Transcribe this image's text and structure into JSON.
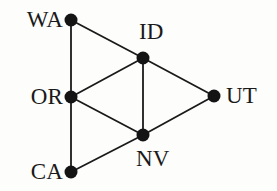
{
  "figure": {
    "background_color": "#fdfdfc",
    "edge_color": "#1a1a1a",
    "node_color": "#141414",
    "label_color": "#1a1a1a",
    "width": 277,
    "height": 191
  },
  "chart_data": {
    "type": "diagram",
    "subtype": "node-link-graph",
    "title": "",
    "directed": false,
    "nodes": [
      {
        "id": "WA",
        "label": "WA",
        "x": 71,
        "y": 20,
        "r": 6.5,
        "label_x": 63,
        "label_y": 20,
        "label_anchor": "right"
      },
      {
        "id": "OR",
        "label": "OR",
        "x": 71,
        "y": 97,
        "r": 6.5,
        "label_x": 63,
        "label_y": 97,
        "label_anchor": "right"
      },
      {
        "id": "CA",
        "label": "CA",
        "x": 71,
        "y": 172,
        "r": 6.5,
        "label_x": 63,
        "label_y": 172,
        "label_anchor": "right"
      },
      {
        "id": "ID",
        "label": "ID",
        "x": 143,
        "y": 58,
        "r": 6.5,
        "label_x": 139,
        "label_y": 32,
        "label_anchor": "left"
      },
      {
        "id": "NV",
        "label": "NV",
        "x": 143,
        "y": 135,
        "r": 6.5,
        "label_x": 136,
        "label_y": 159,
        "label_anchor": "left"
      },
      {
        "id": "UT",
        "label": "UT",
        "x": 214,
        "y": 96,
        "r": 6.5,
        "label_x": 226,
        "label_y": 96,
        "label_anchor": "left"
      }
    ],
    "edges": [
      {
        "source": "WA",
        "target": "OR"
      },
      {
        "source": "OR",
        "target": "CA"
      },
      {
        "source": "WA",
        "target": "ID"
      },
      {
        "source": "OR",
        "target": "ID"
      },
      {
        "source": "OR",
        "target": "NV"
      },
      {
        "source": "CA",
        "target": "NV"
      },
      {
        "source": "ID",
        "target": "NV"
      },
      {
        "source": "ID",
        "target": "UT"
      },
      {
        "source": "NV",
        "target": "UT"
      }
    ],
    "edge_width": 1.8,
    "legend": null,
    "grid": false,
    "axis": false
  }
}
